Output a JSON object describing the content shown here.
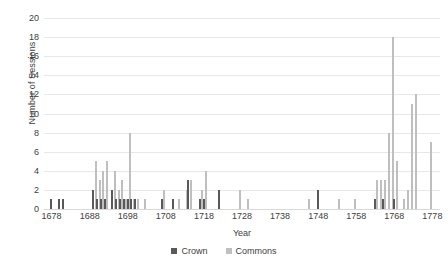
{
  "chart_data": {
    "type": "bar",
    "title": "",
    "xlabel": "Year",
    "ylabel": "Number of Sessions",
    "xlim": [
      1676,
      1780
    ],
    "ylim": [
      0,
      20
    ],
    "ytick_labels": [
      "0",
      "2",
      "4",
      "6",
      "8",
      "10",
      "12",
      "14",
      "16",
      "18",
      "20"
    ],
    "ytick_values": [
      0,
      2,
      4,
      6,
      8,
      10,
      12,
      14,
      16,
      18,
      20
    ],
    "xtick_labels": [
      "1678",
      "1688",
      "1698",
      "1708",
      "1718",
      "1728",
      "1738",
      "1748",
      "1758",
      "1768",
      "1778"
    ],
    "xtick_values": [
      1678,
      1688,
      1698,
      1708,
      1718,
      1728,
      1738,
      1748,
      1758,
      1768,
      1778
    ],
    "grid": "horizontal",
    "legend_position": "bottom",
    "colors": {
      "crown": "#595959",
      "commons": "#bfbfbf",
      "gridline": "#e8e8e8",
      "text": "#404040"
    },
    "series": [
      {
        "name": "Crown",
        "color": "#595959",
        "points": [
          {
            "x": 1678,
            "y": 1
          },
          {
            "x": 1680,
            "y": 1
          },
          {
            "x": 1681,
            "y": 1
          },
          {
            "x": 1689,
            "y": 2
          },
          {
            "x": 1690,
            "y": 1
          },
          {
            "x": 1691,
            "y": 1
          },
          {
            "x": 1692,
            "y": 1
          },
          {
            "x": 1694,
            "y": 2
          },
          {
            "x": 1695,
            "y": 1
          },
          {
            "x": 1696,
            "y": 1
          },
          {
            "x": 1697,
            "y": 1
          },
          {
            "x": 1698,
            "y": 1
          },
          {
            "x": 1699,
            "y": 1
          },
          {
            "x": 1700,
            "y": 1
          },
          {
            "x": 1707,
            "y": 1
          },
          {
            "x": 1710,
            "y": 1
          },
          {
            "x": 1714,
            "y": 3
          },
          {
            "x": 1717,
            "y": 1
          },
          {
            "x": 1718,
            "y": 1
          },
          {
            "x": 1722,
            "y": 2
          },
          {
            "x": 1748,
            "y": 2
          },
          {
            "x": 1763,
            "y": 1
          },
          {
            "x": 1765,
            "y": 1
          },
          {
            "x": 1768,
            "y": 1
          }
        ]
      },
      {
        "name": "Commons",
        "color": "#bfbfbf",
        "points": [
          {
            "x": 1689,
            "y": 5
          },
          {
            "x": 1690,
            "y": 3
          },
          {
            "x": 1691,
            "y": 4
          },
          {
            "x": 1692,
            "y": 5
          },
          {
            "x": 1694,
            "y": 4
          },
          {
            "x": 1695,
            "y": 2
          },
          {
            "x": 1696,
            "y": 3
          },
          {
            "x": 1697,
            "y": 1
          },
          {
            "x": 1698,
            "y": 8
          },
          {
            "x": 1699,
            "y": 1
          },
          {
            "x": 1700,
            "y": 1
          },
          {
            "x": 1702,
            "y": 1
          },
          {
            "x": 1707,
            "y": 2
          },
          {
            "x": 1711,
            "y": 1
          },
          {
            "x": 1713,
            "y": 2
          },
          {
            "x": 1714,
            "y": 3
          },
          {
            "x": 1717,
            "y": 2
          },
          {
            "x": 1718,
            "y": 4
          },
          {
            "x": 1727,
            "y": 2
          },
          {
            "x": 1729,
            "y": 1
          },
          {
            "x": 1745,
            "y": 1
          },
          {
            "x": 1753,
            "y": 1
          },
          {
            "x": 1757,
            "y": 1
          },
          {
            "x": 1763,
            "y": 3
          },
          {
            "x": 1764,
            "y": 3
          },
          {
            "x": 1765,
            "y": 3
          },
          {
            "x": 1766,
            "y": 8
          },
          {
            "x": 1767,
            "y": 18
          },
          {
            "x": 1768,
            "y": 5
          },
          {
            "x": 1770,
            "y": 1
          },
          {
            "x": 1771,
            "y": 2
          },
          {
            "x": 1772,
            "y": 11
          },
          {
            "x": 1773,
            "y": 12
          },
          {
            "x": 1777,
            "y": 7
          }
        ]
      }
    ]
  },
  "legend": {
    "items": [
      {
        "label": "Crown",
        "color": "#595959"
      },
      {
        "label": "Commons",
        "color": "#bfbfbf"
      }
    ]
  }
}
